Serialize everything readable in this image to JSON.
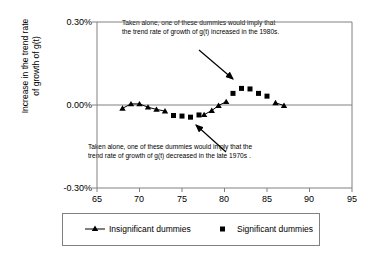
{
  "chart_data": {
    "type": "scatter",
    "title": "",
    "xlabel": "",
    "ylabel": "Increase in the trend rate of growth of g(t)",
    "ylabel_line1": "Increase in the trend rate",
    "ylabel_line2": "of growth of g(t)",
    "xlim": [
      65,
      95
    ],
    "ylim": [
      -0.3,
      0.3
    ],
    "xticks": [
      65,
      70,
      75,
      80,
      85,
      90,
      95
    ],
    "xtick_labels": [
      "65",
      "70",
      "75",
      "80",
      "85",
      "90",
      "95"
    ],
    "yticks": [
      0.3,
      0.0,
      -0.3
    ],
    "ytick_labels": [
      "0.30%",
      "0.00%",
      "-0.30%"
    ],
    "grid": false,
    "legend_position": "bottom",
    "zero_line": true,
    "series": [
      {
        "name": "Insignificant dummies",
        "marker": "triangle",
        "line": true,
        "color": "#000000",
        "points": [
          {
            "x": 68,
            "y": -0.012
          },
          {
            "x": 69,
            "y": 0.004
          },
          {
            "x": 70,
            "y": 0.004
          },
          {
            "x": 71,
            "y": -0.008
          },
          {
            "x": 72,
            "y": -0.016
          },
          {
            "x": 73,
            "y": -0.022
          },
          {
            "x": 77.6,
            "y": -0.035
          },
          {
            "x": 78.5,
            "y": -0.02
          },
          {
            "x": 79.3,
            "y": -0.002
          },
          {
            "x": 80.2,
            "y": 0.012
          },
          {
            "x": 86,
            "y": 0.008
          },
          {
            "x": 87,
            "y": -0.002
          }
        ]
      },
      {
        "name": "Significant dummies",
        "marker": "square",
        "line": false,
        "color": "#000000",
        "points": [
          {
            "x": 74,
            "y": -0.038
          },
          {
            "x": 75,
            "y": -0.04
          },
          {
            "x": 76,
            "y": -0.044
          },
          {
            "x": 77,
            "y": -0.036
          },
          {
            "x": 81,
            "y": 0.042
          },
          {
            "x": 82,
            "y": 0.06
          },
          {
            "x": 83,
            "y": 0.058
          },
          {
            "x": 84,
            "y": 0.042
          },
          {
            "x": 85,
            "y": 0.032
          }
        ]
      }
    ],
    "annotations": [
      {
        "id": "top-annotation",
        "line1": "Taken alone, one of these dummies would  imply that",
        "line2": "the trend rate of growth of g(t) increased in the 1980s.",
        "arrow_from": [
          199,
          50
        ],
        "arrow_to": [
          233,
          79
        ]
      },
      {
        "id": "bottom-annotation",
        "line1": "Taken alone, one of these dummies would imply that the",
        "line2": "trend rate of growth of g(t) decreased in the late 1970s .",
        "arrow_from": [
          226,
          152
        ],
        "arrow_to": [
          196,
          125
        ]
      }
    ],
    "legend_entries": [
      {
        "label": "Insignificant dummies",
        "marker": "triangle-line"
      },
      {
        "label": "Significant dummies",
        "marker": "square"
      }
    ]
  }
}
